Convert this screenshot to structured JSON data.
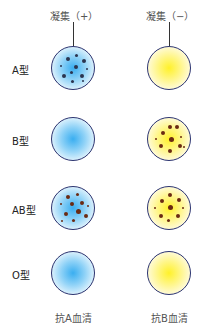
{
  "columns": [
    {
      "header": "凝集（+）",
      "footer": "抗A血清",
      "color": "#3aaef0"
    },
    {
      "header": "凝集（−）",
      "footer": "抗B血清",
      "color": "#fff12a"
    }
  ],
  "rows": [
    {
      "label": "A型",
      "cells": [
        {
          "agglutination": true
        },
        {
          "agglutination": false
        }
      ]
    },
    {
      "label": "B型",
      "cells": [
        {
          "agglutination": false
        },
        {
          "agglutination": true
        }
      ]
    },
    {
      "label": "AB型",
      "cells": [
        {
          "agglutination": true
        },
        {
          "agglutination": true
        }
      ]
    },
    {
      "label": "O型",
      "cells": [
        {
          "agglutination": false
        },
        {
          "agglutination": false
        }
      ]
    }
  ],
  "colors": {
    "dish_border": "#2c3470",
    "clump_blue": "#2b3550",
    "clump_brown": "#6b2a12"
  }
}
